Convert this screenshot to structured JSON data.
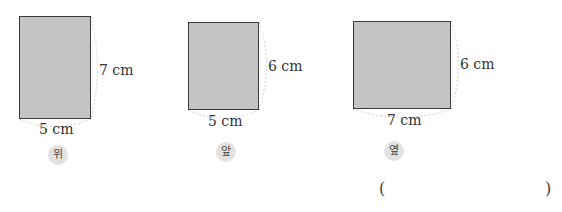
{
  "figures": [
    {
      "view_label": "위",
      "width_label": "5 cm",
      "height_label": "7 cm"
    },
    {
      "view_label": "앞",
      "width_label": "5 cm",
      "height_label": "6 cm"
    },
    {
      "view_label": "옆",
      "width_label": "7 cm",
      "height_label": "6 cm"
    }
  ],
  "answer": {
    "open": "(",
    "close": ")",
    "value": ""
  },
  "colors": {
    "fill": "#c4c4c4",
    "border": "#3a3a3a",
    "badge": "#e2e2e2",
    "dash": "#cccccc"
  }
}
